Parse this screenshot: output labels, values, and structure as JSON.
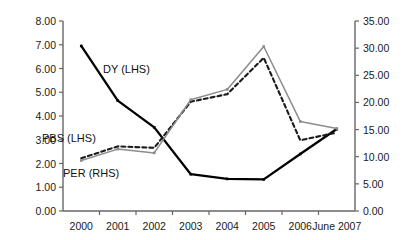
{
  "chart_data": {
    "type": "line",
    "title": "",
    "xlabel": "",
    "ylabel": "",
    "grid": false,
    "legend_position": "inline-annotations",
    "categories": [
      "2000",
      "2001",
      "2002",
      "2003",
      "2004",
      "2005",
      "2006",
      "June 2007"
    ],
    "axes": {
      "left": {
        "label": "LHS",
        "min": 0.0,
        "max": 8.0,
        "step": 1.0,
        "ticks": [
          "0.00",
          "1.00",
          "2.00",
          "3.00",
          "4.00",
          "5.00",
          "6.00",
          "7.00",
          "8.00"
        ]
      },
      "right": {
        "label": "RHS",
        "min": 0.0,
        "max": 35.0,
        "step": 5.0,
        "ticks": [
          "0.00",
          "5.00",
          "10.00",
          "15.00",
          "20.00",
          "25.00",
          "30.00",
          "35.00"
        ]
      }
    },
    "series": [
      {
        "name": "DY (LHS)",
        "axis": "left",
        "style": "solid",
        "color": "#000000",
        "values": [
          6.95,
          4.65,
          3.52,
          1.55,
          1.35,
          1.33,
          2.4,
          3.45
        ]
      },
      {
        "name": "PBS (LHS)",
        "axis": "left",
        "style": "dashed",
        "color": "#1a1a1a",
        "values": [
          2.22,
          2.72,
          2.66,
          4.6,
          4.92,
          6.45,
          2.98,
          3.3
        ]
      },
      {
        "name": "PER (RHS)",
        "axis": "right",
        "style": "solid",
        "color": "#8c8c8c",
        "values": [
          9.3,
          11.4,
          10.7,
          20.5,
          22.4,
          30.3,
          16.5,
          15.2
        ]
      }
    ],
    "annotations": [
      {
        "text": "DY (LHS)",
        "x": 103,
        "y": 64
      },
      {
        "text": "PBS (LHS)",
        "x": 42,
        "y": 133
      },
      {
        "text": "PER (RHS)",
        "x": 63,
        "y": 168
      }
    ]
  }
}
